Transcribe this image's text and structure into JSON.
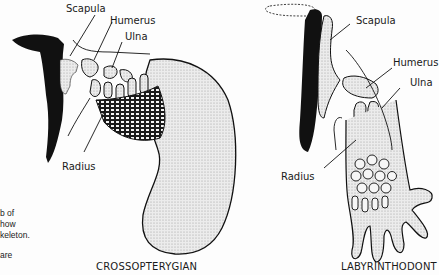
{
  "figure": {
    "left_panel": {
      "caption": "CROSSOPTERYGIAN",
      "labels": {
        "scapula": "Scapula",
        "humerus": "Humerus",
        "ulna": "Ulna",
        "radius": "Radius"
      }
    },
    "right_panel": {
      "caption": "LABYRINTHODONT",
      "labels": {
        "scapula": "Scapula",
        "humerus": "Humerus",
        "ulna": "Ulna",
        "radius": "Radius"
      }
    },
    "side_text": {
      "line1": "b of",
      "line2": "how",
      "line3": "keleton.",
      "line4": "are"
    }
  },
  "colors": {
    "ink": "#111111",
    "stipple": "#d6d6d6",
    "bone": "#e8e8e8"
  }
}
